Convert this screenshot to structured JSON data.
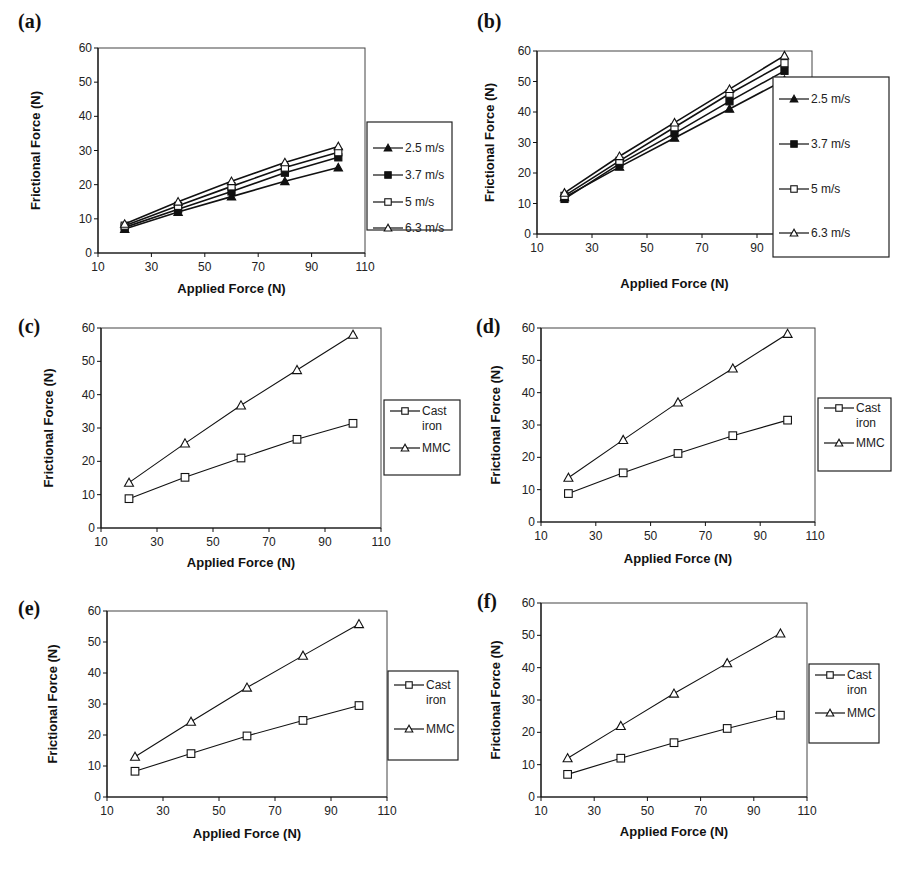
{
  "chart_data": [
    {
      "panel": "(a)",
      "type": "line",
      "xlabel": "Applied Force (N)",
      "ylabel": "Frictional Force (N)",
      "xlim": [
        10,
        110
      ],
      "ylim": [
        0,
        60
      ],
      "xticks": [
        10,
        30,
        50,
        70,
        90,
        110
      ],
      "yticks": [
        0,
        10,
        20,
        30,
        40,
        50,
        60
      ],
      "grid": false,
      "legend_position": "right",
      "x": [
        20,
        40,
        60,
        80,
        100
      ],
      "series": [
        {
          "name": "2.5 m/s",
          "marker": "filled-triangle",
          "values": [
            7,
            12,
            16.5,
            21,
            25
          ]
        },
        {
          "name": "3.7 m/s",
          "marker": "filled-square",
          "values": [
            7.5,
            12.8,
            18,
            23.5,
            28
          ]
        },
        {
          "name": "5 m/s",
          "marker": "open-square",
          "values": [
            8,
            13.8,
            19.5,
            25,
            29.5
          ]
        },
        {
          "name": "6.3 m/s",
          "marker": "open-triangle",
          "values": [
            8.5,
            15,
            21,
            26.5,
            31.2
          ]
        }
      ]
    },
    {
      "panel": "(b)",
      "type": "line",
      "xlabel": "Applied Force (N)",
      "ylabel": "Frictional Force (N)",
      "xlim": [
        10,
        110
      ],
      "ylim": [
        0,
        60
      ],
      "xticks": [
        10,
        30,
        50,
        70,
        90
      ],
      "yticks": [
        0,
        10,
        20,
        30,
        40,
        50,
        60
      ],
      "grid": false,
      "legend_position": "right (overlapping plot)",
      "x": [
        20,
        40,
        60,
        80,
        100
      ],
      "series": [
        {
          "name": "2.5 m/s",
          "marker": "filled-triangle",
          "values": [
            12,
            22,
            31.5,
            41,
            50.5
          ]
        },
        {
          "name": "3.7 m/s",
          "marker": "filled-square",
          "values": [
            11.5,
            23,
            33,
            43.5,
            53.5
          ]
        },
        {
          "name": "5 m/s",
          "marker": "open-square",
          "values": [
            12.5,
            24,
            35,
            46,
            56
          ]
        },
        {
          "name": "6.3 m/s",
          "marker": "open-triangle",
          "values": [
            13.5,
            25.5,
            36.5,
            47.5,
            58.5
          ]
        }
      ]
    },
    {
      "panel": "(c)",
      "type": "line",
      "xlabel": "Applied Force (N)",
      "ylabel": "Frictional Force (N)",
      "xlim": [
        10,
        110
      ],
      "ylim": [
        0,
        60
      ],
      "xticks": [
        10,
        30,
        50,
        70,
        90,
        110
      ],
      "yticks": [
        0,
        10,
        20,
        30,
        40,
        50,
        60
      ],
      "grid": false,
      "legend_position": "right",
      "x": [
        20,
        40,
        60,
        80,
        100
      ],
      "series": [
        {
          "name": "Cast iron",
          "legend_lines": [
            "Cast",
            "iron"
          ],
          "marker": "open-square",
          "values": [
            8.8,
            15.2,
            21,
            26.6,
            31.4
          ]
        },
        {
          "name": "MMC",
          "legend_lines": [
            "MMC"
          ],
          "marker": "open-triangle",
          "values": [
            13.6,
            25.4,
            36.8,
            47.4,
            58
          ]
        }
      ]
    },
    {
      "panel": "(d)",
      "type": "line",
      "xlabel": "Applied Force (N)",
      "ylabel": "Frictional Force (N)",
      "xlim": [
        10,
        110
      ],
      "ylim": [
        0,
        60
      ],
      "xticks": [
        10,
        30,
        50,
        70,
        90,
        110
      ],
      "yticks": [
        0,
        10,
        20,
        30,
        40,
        50,
        60
      ],
      "grid": false,
      "legend_position": "right",
      "x": [
        20,
        40,
        60,
        80,
        100
      ],
      "series": [
        {
          "name": "Cast iron",
          "legend_lines": [
            "Cast",
            "iron"
          ],
          "marker": "open-square",
          "values": [
            8.8,
            15.2,
            21.2,
            26.7,
            31.5
          ]
        },
        {
          "name": "MMC",
          "legend_lines": [
            "MMC"
          ],
          "marker": "open-triangle",
          "values": [
            13.7,
            25.4,
            37,
            47.5,
            58.2
          ]
        }
      ]
    },
    {
      "panel": "(e)",
      "type": "line",
      "xlabel": "Applied Force (N)",
      "ylabel": "Frictional Force (N)",
      "xlim": [
        10,
        110
      ],
      "ylim": [
        0,
        60
      ],
      "xticks": [
        10,
        30,
        50,
        70,
        90,
        110
      ],
      "yticks": [
        0,
        10,
        20,
        30,
        40,
        50,
        60
      ],
      "grid": false,
      "legend_position": "right",
      "x": [
        20,
        40,
        60,
        80,
        100
      ],
      "series": [
        {
          "name": "Cast iron",
          "legend_lines": [
            "Cast",
            "iron"
          ],
          "marker": "open-square",
          "values": [
            8.3,
            14,
            19.7,
            24.7,
            29.5
          ]
        },
        {
          "name": "MMC",
          "legend_lines": [
            "MMC"
          ],
          "marker": "open-triangle",
          "values": [
            13,
            24.3,
            35.3,
            45.6,
            55.8
          ]
        }
      ]
    },
    {
      "panel": "(f)",
      "type": "line",
      "xlabel": "Applied Force (N)",
      "ylabel": "Frictional Force (N)",
      "xlim": [
        10,
        110
      ],
      "ylim": [
        0,
        60
      ],
      "xticks": [
        10,
        30,
        50,
        70,
        90,
        110
      ],
      "yticks": [
        0,
        10,
        20,
        30,
        40,
        50,
        60
      ],
      "grid": false,
      "legend_position": "right",
      "x": [
        20,
        40,
        60,
        80,
        100
      ],
      "series": [
        {
          "name": "Cast iron",
          "legend_lines": [
            "Cast",
            "iron"
          ],
          "marker": "open-square",
          "values": [
            7,
            12,
            16.8,
            21.2,
            25.3
          ]
        },
        {
          "name": "MMC",
          "legend_lines": [
            "MMC"
          ],
          "marker": "open-triangle",
          "values": [
            12,
            22,
            32,
            41.4,
            50.6
          ]
        }
      ]
    }
  ]
}
